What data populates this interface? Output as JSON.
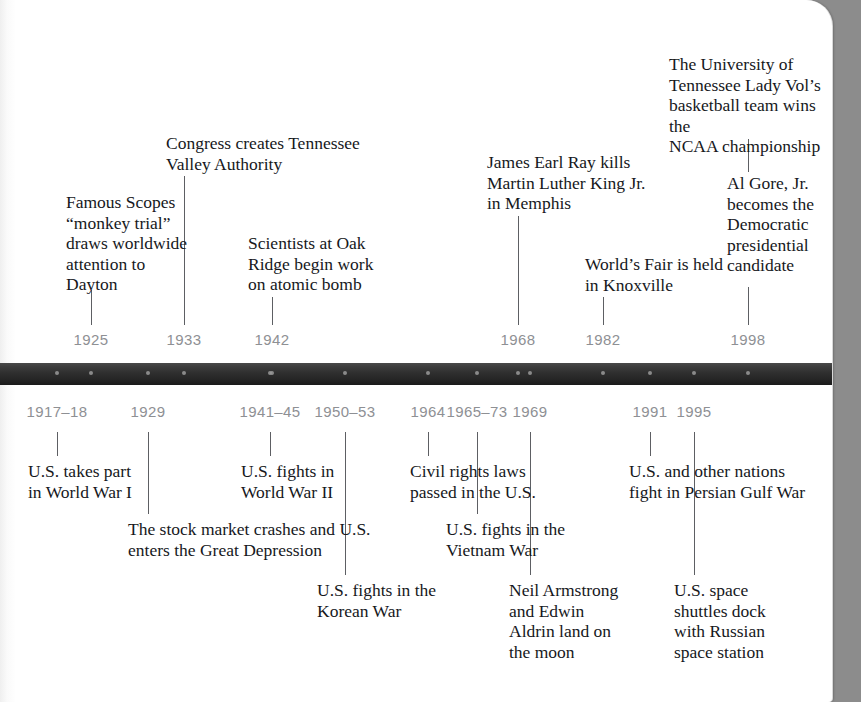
{
  "page": {
    "background_color": "#8c8c8c",
    "paper_color": "#ffffff",
    "bar_color": "#2b2b2b",
    "year_label_color": "#8e9094",
    "text_color": "#16181c"
  },
  "timeline": {
    "above_years": [
      {
        "label": "1925",
        "x": 91
      },
      {
        "label": "1933",
        "x": 184
      },
      {
        "label": "1942",
        "x": 272
      },
      {
        "label": "1968",
        "x": 518
      },
      {
        "label": "1982",
        "x": 603
      },
      {
        "label": "1998",
        "x": 748
      }
    ],
    "below_years": [
      {
        "label": "1917–18",
        "x": 57
      },
      {
        "label": "1929",
        "x": 148
      },
      {
        "label": "1941–45",
        "x": 270
      },
      {
        "label": "1950–53",
        "x": 345
      },
      {
        "label": "1964",
        "x": 428
      },
      {
        "label": "1965–73",
        "x": 477
      },
      {
        "label": "1969",
        "x": 530
      },
      {
        "label": "1991",
        "x": 650
      },
      {
        "label": "1995",
        "x": 694
      }
    ],
    "above_events": [
      {
        "id": "scopes-trial",
        "year": "1925",
        "text": "Famous Scopes\n“monkey trial”\ndraws worldwide\nattention to\nDayton",
        "x": 66,
        "y": 192,
        "width": 130,
        "line_x": 91,
        "line_top": 290,
        "line_bottom": 325
      },
      {
        "id": "tennessee-valley-authority",
        "year": "1933",
        "text": "Congress creates Tennessee\nValley Authority",
        "x": 166,
        "y": 133,
        "width": 200,
        "line_x": 184,
        "line_top": 176,
        "line_bottom": 325
      },
      {
        "id": "oak-ridge-atomic-bomb",
        "year": "1942",
        "text": "Scientists at Oak\nRidge begin work\non atomic bomb",
        "x": 248,
        "y": 233,
        "width": 132,
        "line_x": 272,
        "line_top": 297,
        "line_bottom": 325
      },
      {
        "id": "james-earl-ray-mlk",
        "year": "1968",
        "text": "James Earl Ray kills\nMartin Luther King Jr.\nin Memphis",
        "x": 487,
        "y": 152,
        "width": 180,
        "line_x": 518,
        "line_top": 216,
        "line_bottom": 325
      },
      {
        "id": "worlds-fair-knoxville",
        "year": "1982",
        "text": "World’s Fair is held\nin Knoxville",
        "x": 585,
        "y": 254,
        "width": 140,
        "line_x": 603,
        "line_top": 297,
        "line_bottom": 325
      },
      {
        "id": "lady-vols-ncaa",
        "year": "1998",
        "text": "The University of\nTennessee Lady Vol’s\nbasketball team wins the\nNCAA championship",
        "x": 669,
        "y": 54,
        "width": 166,
        "line_x": 748,
        "line_top": 139,
        "line_bottom": 172
      },
      {
        "id": "al-gore-candidate",
        "year": "1998",
        "text": "Al Gore, Jr.\nbecomes the\nDemocratic\npresidential\ncandidate",
        "x": 727,
        "y": 173,
        "width": 110,
        "line_x": 748,
        "line_top": 287,
        "line_bottom": 325
      }
    ],
    "below_events": [
      {
        "id": "world-war-one",
        "year": "1917–18",
        "text": "U.S. takes part\nin World War I",
        "x": 28,
        "y": 461,
        "width": 130,
        "line_x": 57,
        "line_top": 432,
        "line_bottom": 456
      },
      {
        "id": "stock-market-crash",
        "year": "1929",
        "text": "The stock market crashes and U.S.\nenters the Great Depression",
        "x": 128,
        "y": 519,
        "width": 250,
        "line_x": 148,
        "line_top": 432,
        "line_bottom": 514
      },
      {
        "id": "world-war-two",
        "year": "1941–45",
        "text": "U.S. fights in\nWorld War II",
        "x": 241,
        "y": 461,
        "width": 120,
        "line_x": 270,
        "line_top": 432,
        "line_bottom": 456
      },
      {
        "id": "korean-war",
        "year": "1950–53",
        "text": "U.S. fights in the\nKorean War",
        "x": 317,
        "y": 580,
        "width": 140,
        "line_x": 345,
        "line_top": 432,
        "line_bottom": 575
      },
      {
        "id": "civil-rights-laws",
        "year": "1964",
        "text": "Civil rights laws\npassed in the U.S.",
        "x": 410,
        "y": 461,
        "width": 140,
        "line_x": 428,
        "line_top": 432,
        "line_bottom": 456
      },
      {
        "id": "vietnam-war",
        "year": "1965–73",
        "text": "U.S. fights in the\nVietnam War",
        "x": 446,
        "y": 519,
        "width": 140,
        "line_x": 477,
        "line_top": 432,
        "line_bottom": 514
      },
      {
        "id": "moon-landing",
        "year": "1969",
        "text": "Neil Armstrong\nand Edwin\nAldrin land on\nthe moon",
        "x": 509,
        "y": 580,
        "width": 130,
        "line_x": 530,
        "line_top": 432,
        "line_bottom": 575
      },
      {
        "id": "persian-gulf-war",
        "year": "1991",
        "text": "U.S. and other nations\nfight in Persian Gulf War",
        "x": 629,
        "y": 461,
        "width": 190,
        "line_x": 650,
        "line_top": 432,
        "line_bottom": 456
      },
      {
        "id": "shuttle-mir-docking",
        "year": "1995",
        "text": "U.S. space\nshuttles dock\nwith Russian\nspace station",
        "x": 674,
        "y": 580,
        "width": 120,
        "line_x": 694,
        "line_top": 432,
        "line_bottom": 575
      }
    ],
    "bar_dots": [
      57,
      91,
      148,
      184,
      270,
      272,
      345,
      428,
      477,
      518,
      530,
      603,
      650,
      694,
      748
    ]
  }
}
